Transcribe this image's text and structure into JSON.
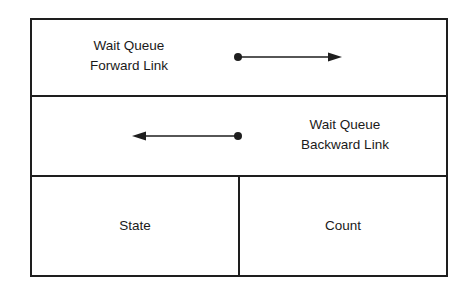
{
  "diagram": {
    "title": "",
    "rows": [
      {
        "id": "forward-link",
        "label_lines": [
          "Wait Queue",
          "Forward Link"
        ],
        "arrow": {
          "direction": "right",
          "from": [
            238,
            57
          ],
          "to": [
            342,
            57
          ]
        }
      },
      {
        "id": "backward-link",
        "label_lines": [
          "Wait Queue",
          "Backward Link"
        ],
        "arrow": {
          "direction": "left",
          "from": [
            238,
            136
          ],
          "to": [
            132,
            136
          ]
        }
      },
      {
        "id": "state-count",
        "cells": [
          {
            "id": "state",
            "label": "State"
          },
          {
            "id": "count",
            "label": "Count"
          }
        ]
      }
    ],
    "colors": {
      "line": "#1e1e1e",
      "text": "#1a1a1a",
      "background": "#ffffff"
    }
  }
}
